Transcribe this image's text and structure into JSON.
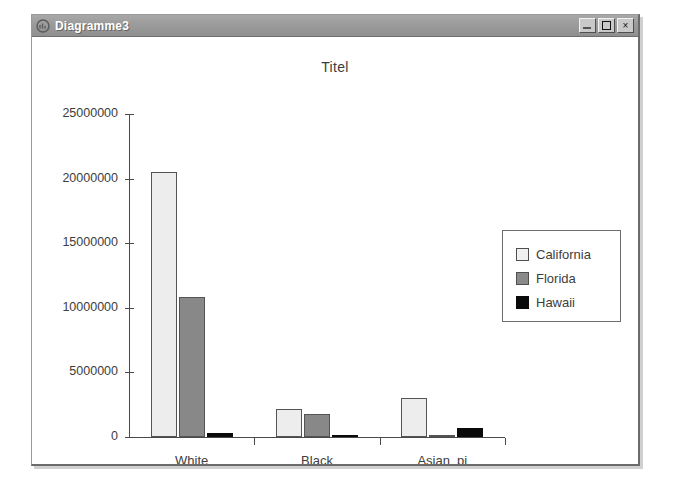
{
  "window": {
    "title": "Diagramme3",
    "icon": "chart-document-icon",
    "controls": {
      "minimize": "_",
      "maximize": "□",
      "close": "×"
    }
  },
  "chart_data": {
    "type": "bar",
    "title": "Titel",
    "xlabel": "",
    "ylabel": "",
    "categories": [
      "White",
      "Black",
      "Asian_pi"
    ],
    "series": [
      {
        "name": "California",
        "color": "#ededed",
        "values": [
          20500000,
          2200000,
          3000000
        ]
      },
      {
        "name": "Florida",
        "color": "#888888",
        "values": [
          10800000,
          1800000,
          150000
        ]
      },
      {
        "name": "Hawaii",
        "color": "#0a0a0a",
        "values": [
          330000,
          30000,
          700000
        ]
      }
    ],
    "ylim": [
      0,
      25000000
    ],
    "yticks": [
      0,
      5000000,
      10000000,
      15000000,
      20000000,
      25000000
    ],
    "ytick_labels": [
      "0",
      "5000000",
      "10000000",
      "15000000",
      "20000000",
      "25000000"
    ],
    "grid": false,
    "legend_position": "right"
  }
}
